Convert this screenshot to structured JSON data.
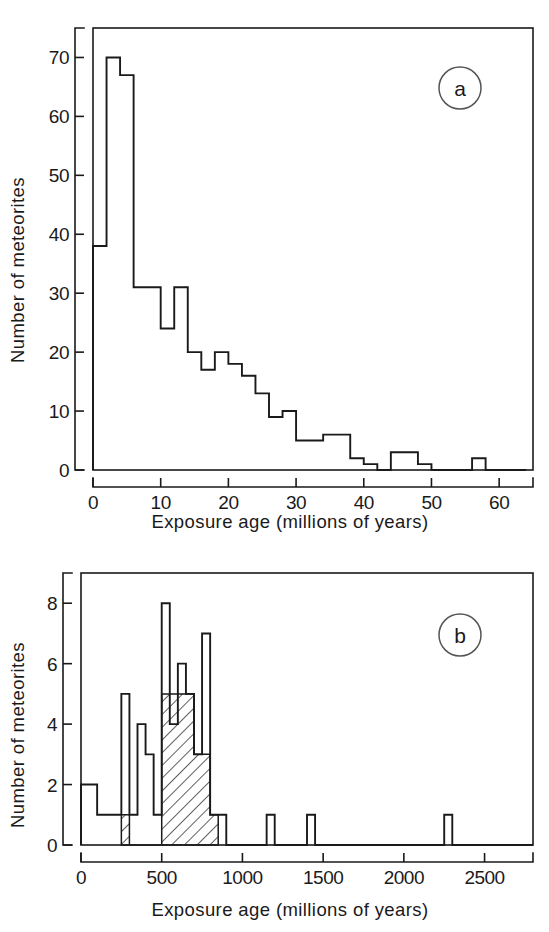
{
  "figure": {
    "panels": [
      {
        "id": "a",
        "label": "a",
        "xlabel": "Exposure  age  (millions  of  years)",
        "ylabel": "Number  of  meteorites"
      },
      {
        "id": "b",
        "label": "b",
        "xlabel": "Exposure  age  (millions  of  years)",
        "ylabel": "Number  of  meteorites"
      }
    ]
  },
  "chart_data": [
    {
      "type": "bar",
      "panel": "a",
      "title": "",
      "xlabel": "Exposure age (millions of years)",
      "ylabel": "Number of meteorites",
      "xlim": [
        0,
        65
      ],
      "ylim": [
        0,
        75
      ],
      "bin_width": 2,
      "xticks": [
        0,
        10,
        20,
        30,
        40,
        50,
        60
      ],
      "yticks": [
        0,
        10,
        20,
        30,
        40,
        50,
        60,
        70
      ],
      "grid": false,
      "legend": false,
      "bin_starts": [
        0,
        2,
        4,
        6,
        8,
        10,
        12,
        14,
        16,
        18,
        20,
        22,
        24,
        26,
        28,
        30,
        32,
        34,
        36,
        38,
        40,
        42,
        44,
        46,
        48,
        50,
        52,
        54,
        56,
        58,
        60,
        62
      ],
      "values": [
        38,
        70,
        67,
        31,
        31,
        24,
        31,
        20,
        17,
        20,
        18,
        16,
        13,
        9,
        10,
        5,
        5,
        6,
        6,
        2,
        1,
        0,
        3,
        3,
        1,
        0,
        0,
        0,
        2,
        0,
        0,
        0
      ]
    },
    {
      "type": "bar",
      "panel": "b",
      "title": "",
      "xlabel": "Exposure age (millions of years)",
      "ylabel": "Number of meteorites",
      "xlim": [
        0,
        2800
      ],
      "ylim": [
        0,
        9
      ],
      "bin_width": 50,
      "xticks": [
        0,
        500,
        1000,
        1500,
        2000,
        2500
      ],
      "yticks": [
        0,
        2,
        4,
        6,
        8
      ],
      "grid": false,
      "legend": false,
      "bin_starts": [
        0,
        50,
        100,
        150,
        200,
        250,
        300,
        350,
        400,
        450,
        500,
        550,
        600,
        650,
        700,
        750,
        800,
        850,
        900,
        950,
        1000,
        1050,
        1100,
        1150,
        1200,
        1250,
        1300,
        1350,
        1400,
        1450,
        1500,
        1550,
        1600,
        1650,
        1700,
        1750,
        1800,
        1850,
        1900,
        1950,
        2000,
        2050,
        2100,
        2150,
        2200,
        2250,
        2300,
        2350,
        2400,
        2450,
        2500,
        2550,
        2600,
        2650,
        2700,
        2750
      ],
      "values": [
        2,
        2,
        1,
        1,
        1,
        5,
        1,
        4,
        3,
        1,
        8,
        4,
        6,
        5,
        3,
        7,
        1,
        1,
        0,
        0,
        0,
        0,
        0,
        1,
        0,
        0,
        0,
        0,
        1,
        0,
        0,
        0,
        0,
        0,
        0,
        0,
        0,
        0,
        0,
        0,
        0,
        0,
        0,
        0,
        0,
        1,
        0,
        0,
        0,
        0,
        0,
        0,
        0,
        0,
        0,
        0
      ],
      "hatched_values": [
        0,
        0,
        0,
        0,
        0,
        1,
        0,
        0,
        0,
        0,
        5,
        5,
        5,
        5,
        3,
        3,
        1,
        0,
        0,
        0,
        0,
        0,
        0,
        0,
        0,
        0,
        0,
        0,
        0,
        0,
        0,
        0,
        0,
        0,
        0,
        0,
        0,
        0,
        0,
        0,
        0,
        0,
        0,
        0,
        0,
        0,
        0,
        0,
        0,
        0,
        0,
        0,
        0,
        0,
        0,
        0
      ],
      "hatch_note": "diagonal-striped sub-population"
    }
  ],
  "colors": {
    "ink": "#1a1a1a",
    "background": "#ffffff"
  }
}
